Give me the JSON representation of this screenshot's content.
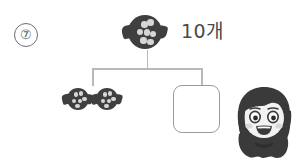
{
  "worksheet": {
    "problem_number": "⑦",
    "quantity_label": "10개",
    "answer_box_value": "",
    "answer_box_placeholder": "",
    "colors": {
      "candy_body": "#3f3f3f",
      "candy_dot": "#d6d6d6",
      "connector_line": "#b9b9b9",
      "answer_box_border": "#9a9a9a",
      "text": "#4a4a4a",
      "background": "#ffffff",
      "girl_hair": "#3a3a3a",
      "girl_skin": "#f2f2f2"
    },
    "diagram": {
      "type": "number-bond",
      "whole": {
        "icon": "candy-icon",
        "label": "10개",
        "count": 10
      },
      "parts": [
        {
          "icon": "candy-icon",
          "count": 2,
          "shown": true
        },
        {
          "icon": "answer-box",
          "count": null,
          "shown": false
        }
      ]
    },
    "candy_dots": {
      "whole": [
        {
          "x": 39,
          "y": 18
        },
        {
          "x": 57,
          "y": 13
        },
        {
          "x": 25,
          "y": 41
        },
        {
          "x": 46,
          "y": 42
        },
        {
          "x": 65,
          "y": 46
        },
        {
          "x": 36,
          "y": 66
        },
        {
          "x": 57,
          "y": 70
        }
      ],
      "part": [
        {
          "x": 30,
          "y": 22
        },
        {
          "x": 55,
          "y": 18
        },
        {
          "x": 22,
          "y": 50
        },
        {
          "x": 48,
          "y": 50
        },
        {
          "x": 70,
          "y": 42
        },
        {
          "x": 38,
          "y": 74
        }
      ]
    },
    "character": {
      "name": "girl-character",
      "description": "smiling girl with bob haircut"
    }
  }
}
